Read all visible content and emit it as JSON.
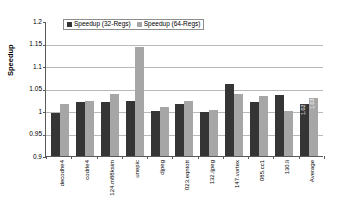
{
  "chart_data": {
    "type": "bar",
    "title": "",
    "xlabel": "",
    "ylabel": "Speedup",
    "ylim": [
      0.9,
      1.2
    ],
    "yticks": [
      "0.9",
      "0.95",
      "1",
      "1.05",
      "1.1",
      "1.15",
      "1.2"
    ],
    "grid": true,
    "legend_position": "top-center",
    "categories": [
      "decodhe4",
      "codrle4",
      "124.m88ksim",
      "unepic",
      "djpeg",
      "023.eqntott",
      "132.ijpeg",
      "147.vortex",
      "085.cc1",
      "130.li",
      "Average"
    ],
    "series": [
      {
        "name": "Speedup (32-Regs)",
        "color": "#353535",
        "values": [
          0.996,
          1.021,
          1.02,
          1.022,
          1.001,
          1.015,
          0.997,
          1.061,
          1.02,
          1.035,
          1.016
        ]
      },
      {
        "name": "Speedup (64-Regs)",
        "color": "#a6a6a6",
        "values": [
          1.016,
          1.022,
          1.037,
          1.142,
          1.01,
          1.022,
          1.002,
          1.037,
          1.033,
          1.001,
          1.029
        ]
      }
    ],
    "data_labels": {
      "Average": {
        "s32": "1.02",
        "s64": "1.03"
      }
    }
  }
}
